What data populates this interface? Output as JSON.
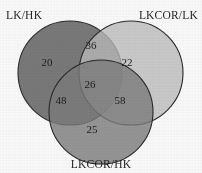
{
  "figure": {
    "type": "venn3",
    "background_color": "#fdfdfd"
  },
  "sets": {
    "left": {
      "label": "LK/HK",
      "fill_color": "#6e6e6e",
      "stroke_color": "#262626",
      "cx": 70,
      "cy": 73,
      "r": 52
    },
    "right": {
      "label": "LKCOR/LK",
      "fill_color": "#bdbdbd",
      "stroke_color": "#262626",
      "cx": 131,
      "cy": 73,
      "r": 52
    },
    "bottom": {
      "label": "LKCOR/HK",
      "fill_color": "#7c7c7c",
      "stroke_color": "#262626",
      "cx": 101,
      "cy": 112,
      "r": 52
    }
  },
  "regions": [
    {
      "key": "left_only",
      "value": "20",
      "x": 47,
      "y": 62
    },
    {
      "key": "left_right",
      "value": "36",
      "x": 91,
      "y": 45
    },
    {
      "key": "right_only",
      "value": "22",
      "x": 127,
      "y": 62
    },
    {
      "key": "all_three",
      "value": "26",
      "x": 90,
      "y": 84
    },
    {
      "key": "left_bottom",
      "value": "48",
      "x": 61,
      "y": 100
    },
    {
      "key": "right_bottom",
      "value": "58",
      "x": 120,
      "y": 100
    },
    {
      "key": "bottom_only",
      "value": "25",
      "x": 92,
      "y": 129
    }
  ],
  "chart_data": {
    "type": "venn",
    "title": "",
    "set_labels": [
      "LK/HK",
      "LKCOR/LK",
      "LKCOR/HK"
    ],
    "region_labels": [
      "left_only",
      "left_right",
      "right_only",
      "all_three",
      "left_bottom",
      "right_bottom",
      "bottom_only"
    ],
    "values": {
      "left_only": 20,
      "left_right": 36,
      "right_only": 22,
      "all_three": 26,
      "left_bottom": 48,
      "right_bottom": 58,
      "bottom_only": 25
    },
    "totals": {
      "LK/HK": 130,
      "LKCOR/LK": 142,
      "LKCOR/HK": 157
    },
    "colors": {
      "LK/HK": "#6e6e6e",
      "LKCOR/LK": "#bdbdbd",
      "LKCOR/HK": "#7c7c7c"
    },
    "grid": false,
    "legend": "inline-set-labels"
  }
}
